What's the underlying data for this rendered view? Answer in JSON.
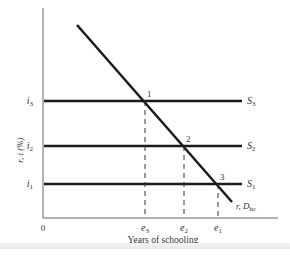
{
  "diagram": {
    "y_axis_label": "r, i (%)",
    "x_axis_label": "Years of schooling",
    "origin_label": "0",
    "demand_label": {
      "main": "r, D",
      "sub": "hc"
    },
    "supply_lines": [
      {
        "label": "S",
        "sub": "3",
        "rate_label": "i",
        "rate_sub": "3",
        "point": "1",
        "schooling": "e",
        "schooling_sub": "3"
      },
      {
        "label": "S",
        "sub": "2",
        "rate_label": "i",
        "rate_sub": "2",
        "point": "2",
        "schooling": "e",
        "schooling_sub": "2"
      },
      {
        "label": "S",
        "sub": "1",
        "rate_label": "i",
        "rate_sub": "1",
        "point": "3",
        "schooling": "e",
        "schooling_sub": "1"
      }
    ],
    "colors": {
      "line": "#1a1a1a",
      "axis": "#555555",
      "text": "#333333"
    }
  }
}
